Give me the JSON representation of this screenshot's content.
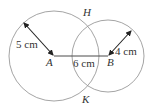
{
  "diagram": {
    "circle_a": {
      "center_label": "A",
      "radius_label": "5 cm",
      "cx": 54,
      "cy": 56,
      "r": 45
    },
    "circle_b": {
      "center_label": "B",
      "radius_label": "4 cm",
      "cx": 108,
      "cy": 56,
      "r": 36
    },
    "segment_ab": {
      "label": "6 cm"
    },
    "intersections": {
      "top": "H",
      "bottom": "K"
    },
    "colors": {
      "circle_stroke": "#9a9a9a",
      "segment_stroke": "#4a4a4a",
      "arrow_stroke": "#222222",
      "text": "#333333"
    }
  }
}
